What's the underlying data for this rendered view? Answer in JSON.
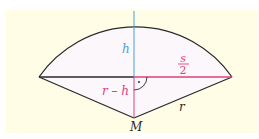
{
  "diagram": {
    "type": "circular-segment-geometry",
    "colors": {
      "background": "#fffde6",
      "segment_fill": "#fbf7fb",
      "outline": "#2a2a2a",
      "height_line": "#4a9fd8",
      "accent_pink": "#e0407a"
    },
    "labels": {
      "height": "h",
      "half_chord_numerator": "s",
      "half_chord_denominator": "2",
      "center_distance": "r – h",
      "radius": "r",
      "center": "M"
    }
  }
}
